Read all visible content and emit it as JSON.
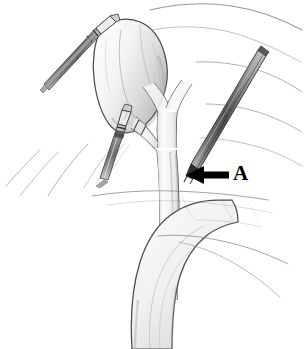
{
  "figure": {
    "background_color": "#ffffff",
    "ink_color": "#3c3c3c",
    "shade_color": "#c8c8c8",
    "metal_color": "#8f8f8f",
    "annotation_color": "#000000",
    "width": 304,
    "height": 349
  },
  "annotations": [
    {
      "name": "arrow-a",
      "label": "A",
      "points_to": "cystic duct and common bile duct junction",
      "direction": "left",
      "tail_x": 228,
      "tail_y": 175,
      "tip_x": 187,
      "tip_y": 175
    }
  ],
  "structures": {
    "gallbladder": "Gallbladder",
    "cystic_duct": "Cystic duct",
    "common_bile_duct": "Common bile duct",
    "common_hepatic_duct": "Common hepatic duct",
    "right_hepatic_duct": "Right hepatic duct",
    "left_hepatic_duct": "Left hepatic duct",
    "duodenum": "Duodenum",
    "liver_edge": "Liver inferior edge"
  },
  "instruments": [
    {
      "name": "fundus-grasper",
      "label": "Laparoscopic grasper on gallbladder fundus",
      "entry": "upper left"
    },
    {
      "name": "infundibulum-grasper",
      "label": "Laparoscopic grasper on gallbladder infundibulum",
      "entry": "lower left"
    },
    {
      "name": "dissector",
      "label": "Laparoscopic dissector at cystic duct",
      "entry": "upper right"
    }
  ]
}
